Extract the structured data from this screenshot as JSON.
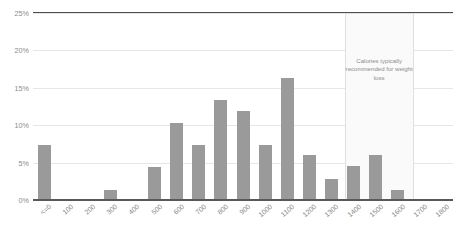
{
  "chart_data": {
    "type": "bar",
    "title": "",
    "subtitle": "",
    "xlabel": "",
    "ylabel": "",
    "categories": [
      "<=0",
      "100",
      "200",
      "300",
      "400",
      "500",
      "600",
      "700",
      "800",
      "900",
      "1000",
      "1100",
      "1200",
      "1300",
      "1400",
      "1500",
      "1600",
      "1700",
      "1800"
    ],
    "values": [
      7.4,
      0,
      0,
      1.4,
      0,
      4.4,
      10.3,
      7.3,
      13.4,
      11.9,
      7.3,
      16.3,
      6.0,
      2.8,
      4.5,
      6.0,
      1.4,
      0,
      0
    ],
    "ylim": [
      0,
      25
    ],
    "yticks": [
      0,
      5,
      10,
      15,
      20,
      25
    ],
    "ytick_labels": [
      "0%",
      "5%",
      "10%",
      "15%",
      "20%",
      "25%"
    ],
    "grid": true,
    "legend": false,
    "bar_color": "#9a9a9a",
    "gridline_color": "#e6e6e6",
    "axis_color": "#595959",
    "annotations": [
      {
        "text": "Calories typically recommended for weight loss",
        "band_start_category": "1400",
        "band_end_category": "1700",
        "band_fill": "#fafafa",
        "band_border": "#e0e0e0",
        "text_color": "#8c8c8c"
      }
    ]
  }
}
